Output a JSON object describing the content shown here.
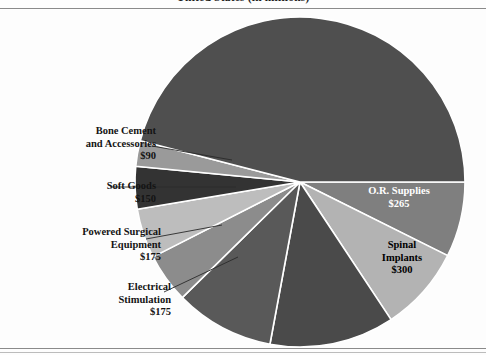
{
  "header": {
    "title": "United States (in millions)",
    "title_clipped": true
  },
  "chart_data": {
    "type": "pie",
    "title": "United States (in millions)",
    "units": "millions of USD",
    "legend_position": "callout-labels",
    "grid": false,
    "center": {
      "x": 300,
      "y": 182
    },
    "radius": 165,
    "start_angle_deg": 0,
    "direction": "clockwise",
    "categories": [
      "O.R. Supplies",
      "Spinal Implants",
      "Orthopedic Implants",
      "Arthroscopy",
      "Electrical Stimulation",
      "Powered Surgical Equipment",
      "Soft Goods",
      "Bone Cement and Accessories",
      "Other"
    ],
    "values": [
      265,
      300,
      440,
      350,
      175,
      175,
      150,
      90,
      1900
    ],
    "labels_visible": [
      {
        "name": "O.R. Supplies",
        "value": "$265",
        "placement": "inside",
        "text_color": "#ffffff"
      },
      {
        "name": "Spinal Implants",
        "value": "$300",
        "placement": "inside",
        "text_color": "#000000"
      },
      {
        "name": "Electrical Stimulation",
        "value": "$175",
        "placement": "callout-left"
      },
      {
        "name": "Powered Surgical Equipment",
        "value": "$175",
        "placement": "callout-left"
      },
      {
        "name": "Soft Goods",
        "value": "$150",
        "placement": "callout-left"
      },
      {
        "name": "Bone Cement and Accessories",
        "value": "$90",
        "placement": "callout-left"
      }
    ],
    "slices": [
      {
        "label": "O.R. Supplies",
        "value": 265,
        "value_text": "$265",
        "start": 0,
        "end": 26.5,
        "color": "#7f7f7f"
      },
      {
        "label": "Spinal Implants",
        "value": 300,
        "value_text": "$300",
        "start": 26.5,
        "end": 56.5,
        "color": "#b3b3b3"
      },
      {
        "label": "Slice C",
        "value": 440,
        "value_text": "",
        "start": 56.5,
        "end": 100.5,
        "color": "#4a4a4a"
      },
      {
        "label": "Slice D",
        "value": 350,
        "value_text": "",
        "start": 100.5,
        "end": 135.5,
        "color": "#595959"
      },
      {
        "label": "Electrical Stimulation",
        "value": 175,
        "value_text": "$175",
        "start": 135.5,
        "end": 153.0,
        "color": "#8c8c8c"
      },
      {
        "label": "Powered Surgical Equipment",
        "value": 175,
        "value_text": "$175",
        "start": 153.0,
        "end": 170.5,
        "color": "#bdbdbd"
      },
      {
        "label": "Soft Goods",
        "value": 150,
        "value_text": "$150",
        "start": 170.5,
        "end": 185.5,
        "color": "#333333"
      },
      {
        "label": "Bone Cement and Accessories",
        "value": 90,
        "value_text": "$90",
        "start": 185.5,
        "end": 194.5,
        "color": "#9a9a9a"
      },
      {
        "label": "Remainder",
        "value": 1900,
        "value_text": "",
        "start": 194.5,
        "end": 360.0,
        "color": "#4f4f4f"
      }
    ]
  },
  "labels": {
    "bone_cement": {
      "line1": "Bone Cement",
      "line2": "and Accessories",
      "line3": "$90"
    },
    "soft_goods": {
      "line1": "Soft Goods",
      "line2": "$150"
    },
    "powered_surgical": {
      "line1": "Powered Surgical",
      "line2": "Equipment",
      "line3": "$175"
    },
    "electrical_stim": {
      "line1": "Electrical",
      "line2": "Stimulation",
      "line3": "$175"
    },
    "or_supplies": {
      "line1": "O.R. Supplies",
      "line2": "$265"
    },
    "spinal_implants": {
      "line1": "Spinal",
      "line2": "Implants",
      "line3": "$300"
    }
  },
  "colors": {
    "background": "#fdfdfd",
    "rule": "#8a8a8a",
    "slice_darkest": "#333333",
    "slice_dark": "#4f4f4f",
    "slice_mid": "#7f7f7f",
    "slice_light": "#b3b3b3",
    "slice_lightest": "#bdbdbd",
    "separator": "#ffffff",
    "text": "#141414",
    "text_inverse": "#ffffff"
  }
}
